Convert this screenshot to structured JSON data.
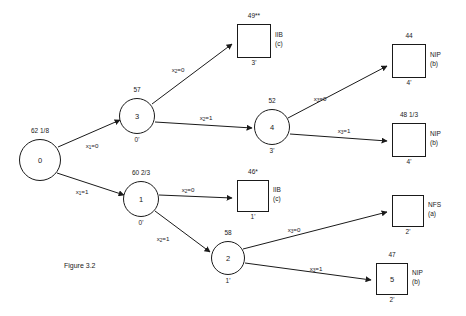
{
  "figure": {
    "caption": "Figure 3.2",
    "caption_x": 64,
    "caption_y": 262
  },
  "nodes": [
    {
      "id": "node-0",
      "label": "0",
      "top_label": "62 1/8",
      "bottom_label": "",
      "cx": 40,
      "cy": 160,
      "r": 21
    },
    {
      "id": "node-3",
      "label": "3",
      "top_label": "57",
      "bottom_label": "0'",
      "cx": 137,
      "cy": 116,
      "r": 18
    },
    {
      "id": "node-1",
      "label": "1",
      "top_label": "60 2/3",
      "bottom_label": "0'",
      "cx": 141,
      "cy": 199,
      "r": 18
    },
    {
      "id": "node-4",
      "label": "4",
      "top_label": "52",
      "bottom_label": "3'",
      "cx": 272,
      "cy": 127,
      "r": 18
    },
    {
      "id": "node-2",
      "label": "2",
      "top_label": "58",
      "bottom_label": "1'",
      "cx": 228,
      "cy": 258,
      "r": 17
    }
  ],
  "leaves": [
    {
      "id": "leaf-49",
      "label": "",
      "top_label": "49**",
      "bottom_label": "3'",
      "side_line1": "IIB",
      "side_line2": "(c)",
      "x": 237,
      "y": 24,
      "w": 34,
      "h": 34
    },
    {
      "id": "leaf-44",
      "label": "",
      "top_label": "44",
      "bottom_label": "4'",
      "side_line1": "NIP",
      "side_line2": "(b)",
      "x": 392,
      "y": 44,
      "w": 34,
      "h": 34
    },
    {
      "id": "leaf-48-1-3",
      "label": "",
      "top_label": "48 1/3",
      "bottom_label": "4'",
      "side_line1": "NIP",
      "side_line2": "(b)",
      "x": 392,
      "y": 123,
      "w": 34,
      "h": 34
    },
    {
      "id": "leaf-46",
      "label": "",
      "top_label": "46*",
      "bottom_label": "1'",
      "side_line1": "IIB",
      "side_line2": "(c)",
      "x": 237,
      "y": 180,
      "w": 32,
      "h": 32
    },
    {
      "id": "leaf-nfs",
      "label": "",
      "top_label": "",
      "bottom_label": "2'",
      "side_line1": "NFS",
      "side_line2": "(a)",
      "x": 392,
      "y": 195,
      "w": 32,
      "h": 32
    },
    {
      "id": "leaf-47",
      "label": "5",
      "top_label": "47",
      "bottom_label": "2'",
      "side_line1": "NIP",
      "side_line2": "(b)",
      "x": 376,
      "y": 263,
      "w": 32,
      "h": 32
    }
  ],
  "edges": [
    {
      "id": "edge-0-3",
      "from": "node-0",
      "to": "node-3",
      "x1": 58,
      "y1": 147,
      "x2": 120,
      "y2": 120,
      "label_var": "x",
      "label_sub": "1",
      "label_val": "=0",
      "lx": 92,
      "ly": 142
    },
    {
      "id": "edge-0-1",
      "from": "node-0",
      "to": "node-1",
      "x1": 57,
      "y1": 173,
      "x2": 124,
      "y2": 195,
      "label_var": "x",
      "label_sub": "1",
      "label_val": "=1",
      "lx": 82,
      "ly": 188
    },
    {
      "id": "edge-3-49",
      "from": "node-3",
      "to": "leaf-49",
      "x1": 152,
      "y1": 104,
      "x2": 232,
      "y2": 44,
      "label_var": "x",
      "label_sub": "2",
      "label_val": "=0",
      "lx": 178,
      "ly": 66
    },
    {
      "id": "edge-3-4",
      "from": "node-3",
      "to": "node-4",
      "x1": 155,
      "y1": 122,
      "x2": 252,
      "y2": 128,
      "label_var": "x",
      "label_sub": "2",
      "label_val": "=1",
      "lx": 206,
      "ly": 114
    },
    {
      "id": "edge-4-44",
      "from": "node-4",
      "to": "leaf-44",
      "x1": 288,
      "y1": 118,
      "x2": 387,
      "y2": 66,
      "label_var": "x",
      "label_sub": "3",
      "label_val": "=0",
      "lx": 320,
      "ly": 95
    },
    {
      "id": "edge-4-48",
      "from": "node-4",
      "to": "leaf-48-1-3",
      "x1": 290,
      "y1": 134,
      "x2": 387,
      "y2": 141,
      "label_var": "x",
      "label_sub": "3",
      "label_val": "=1",
      "lx": 344,
      "ly": 127
    },
    {
      "id": "edge-1-46",
      "from": "node-1",
      "to": "leaf-46",
      "x1": 159,
      "y1": 195,
      "x2": 232,
      "y2": 198,
      "label_var": "x",
      "label_sub": "2",
      "label_val": "=0",
      "lx": 188,
      "ly": 186
    },
    {
      "id": "edge-1-2",
      "from": "node-1",
      "to": "node-2",
      "x1": 155,
      "y1": 211,
      "x2": 210,
      "y2": 252,
      "label_var": "x",
      "label_sub": "2",
      "label_val": "=1",
      "lx": 163,
      "ly": 235
    },
    {
      "id": "edge-2-nfs",
      "from": "node-2",
      "to": "leaf-nfs",
      "x1": 243,
      "y1": 249,
      "x2": 387,
      "y2": 212,
      "label_var": "x",
      "label_sub": "3",
      "label_val": "=0",
      "lx": 294,
      "ly": 226
    },
    {
      "id": "edge-2-47",
      "from": "node-2",
      "to": "leaf-47",
      "x1": 245,
      "y1": 263,
      "x2": 371,
      "y2": 280,
      "label_var": "x",
      "label_sub": "3",
      "label_val": "=1",
      "lx": 316,
      "ly": 265
    }
  ],
  "colors": {
    "stroke": "#1a1a1a",
    "background": "#ffffff"
  }
}
